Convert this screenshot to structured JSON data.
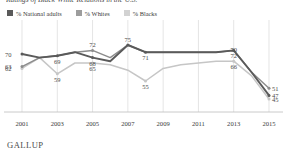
{
  "chart_data": {
    "type": "line",
    "title": "Ratings of Black-White Relations in the U.S.",
    "xlabel": "",
    "ylabel": "",
    "x": [
      2001,
      2002,
      2003,
      2004,
      2005,
      2006,
      2007,
      2008,
      2009,
      2010,
      2011,
      2012,
      2013,
      2014,
      2015
    ],
    "tick_years": [
      "2001",
      "2003",
      "2005",
      "2007",
      "2009",
      "2011",
      "2013",
      "2015"
    ],
    "grid": "vertical",
    "legend_position": "top-left",
    "ylim": [
      40,
      80
    ],
    "series": [
      {
        "name": "% National adults",
        "color": "#5a5a5a",
        "points": [
          {
            "x": 2001,
            "y": 70,
            "label": "70"
          },
          {
            "x": 2002,
            "y": 68,
            "label": ""
          },
          {
            "x": 2003,
            "y": 69,
            "label": "69"
          },
          {
            "x": 2004,
            "y": 71,
            "label": ""
          },
          {
            "x": 2005,
            "y": 68,
            "label": "68"
          },
          {
            "x": 2006,
            "y": 66,
            "label": ""
          },
          {
            "x": 2007,
            "y": 75,
            "label": "75"
          },
          {
            "x": 2008,
            "y": 71,
            "label": "71"
          },
          {
            "x": 2009,
            "y": 71,
            "label": ""
          },
          {
            "x": 2010,
            "y": 71,
            "label": ""
          },
          {
            "x": 2011,
            "y": 71,
            "label": ""
          },
          {
            "x": 2012,
            "y": 71,
            "label": ""
          },
          {
            "x": 2013,
            "y": 72,
            "label": "72"
          },
          {
            "x": 2014,
            "y": 60,
            "label": ""
          },
          {
            "x": 2015,
            "y": 47,
            "label": "47"
          }
        ]
      },
      {
        "name": "% Whites",
        "color": "#8c8c8c",
        "points": [
          {
            "x": 2001,
            "y": 63,
            "label": "63"
          },
          {
            "x": 2002,
            "y": 68,
            "label": ""
          },
          {
            "x": 2003,
            "y": 69,
            "label": ""
          },
          {
            "x": 2004,
            "y": 71,
            "label": ""
          },
          {
            "x": 2005,
            "y": 72,
            "label": "72"
          },
          {
            "x": 2006,
            "y": 68,
            "label": ""
          },
          {
            "x": 2007,
            "y": 75,
            "label": ""
          },
          {
            "x": 2008,
            "y": 71,
            "label": ""
          },
          {
            "x": 2009,
            "y": 71,
            "label": ""
          },
          {
            "x": 2010,
            "y": 71,
            "label": ""
          },
          {
            "x": 2011,
            "y": 71,
            "label": ""
          },
          {
            "x": 2012,
            "y": 71,
            "label": ""
          },
          {
            "x": 2013,
            "y": 72,
            "label": ""
          },
          {
            "x": 2014,
            "y": 60,
            "label": ""
          },
          {
            "x": 2015,
            "y": 51,
            "label": "51"
          }
        ]
      },
      {
        "name": "% Blacks",
        "color": "#c6c6c6",
        "points": [
          {
            "x": 2001,
            "y": 62,
            "label": "62"
          },
          {
            "x": 2002,
            "y": 68,
            "label": ""
          },
          {
            "x": 2003,
            "y": 59,
            "label": "59"
          },
          {
            "x": 2004,
            "y": 65,
            "label": ""
          },
          {
            "x": 2005,
            "y": 65,
            "label": "65"
          },
          {
            "x": 2006,
            "y": 64,
            "label": ""
          },
          {
            "x": 2007,
            "y": 61,
            "label": ""
          },
          {
            "x": 2008,
            "y": 55,
            "label": "55"
          },
          {
            "x": 2009,
            "y": 62,
            "label": ""
          },
          {
            "x": 2010,
            "y": 64,
            "label": ""
          },
          {
            "x": 2011,
            "y": 65,
            "label": ""
          },
          {
            "x": 2012,
            "y": 66,
            "label": ""
          },
          {
            "x": 2013,
            "y": 66,
            "label": "66"
          },
          {
            "x": 2014,
            "y": 58,
            "label": ""
          },
          {
            "x": 2015,
            "y": 45,
            "label": "45"
          }
        ]
      }
    ],
    "extra_labels": [
      {
        "text": "70",
        "x": 2013,
        "series": "% Whites",
        "y": 70
      }
    ]
  },
  "legend": {
    "items": [
      {
        "label": "% National adults",
        "color": "#5a5a5a"
      },
      {
        "label": "% Whites",
        "color": "#8c8c8c"
      },
      {
        "label": "% Blacks",
        "color": "#c6c6c6"
      }
    ]
  },
  "footer": {
    "brand": "GALLUP"
  }
}
